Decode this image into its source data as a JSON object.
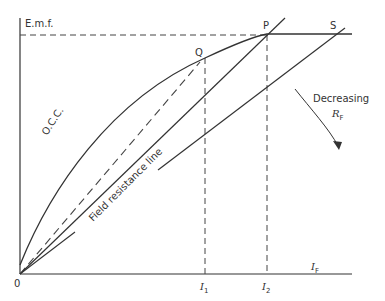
{
  "diagram": {
    "axes": {
      "y_label": "E.m.f.",
      "x_label_main": "I",
      "x_label_sub": "F",
      "origin_label": "0"
    },
    "points": {
      "P": "P",
      "Q": "Q",
      "S": "S"
    },
    "ticks": {
      "I1_main": "I",
      "I1_sub": "1",
      "I2_main": "I",
      "I2_sub": "2"
    },
    "curves": {
      "occ_label": "O.C.C.",
      "field_line_label": "Field resistance line"
    },
    "annotation": {
      "text": "Decreasing",
      "symbol_main": "R",
      "symbol_sub": "F"
    },
    "colors": {
      "line": "#333333",
      "background": "#ffffff"
    }
  }
}
